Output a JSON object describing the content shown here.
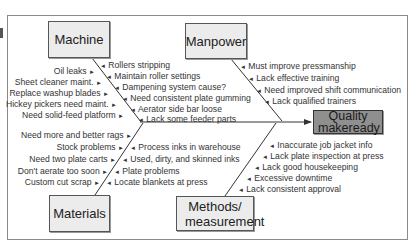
{
  "diagram": {
    "type": "fishbone",
    "effect": "Quality makeready",
    "categories": {
      "machine": {
        "title": "Machine",
        "left_causes": [
          "Oil leaks",
          "Sheet cleaner maint.",
          "Replace washup blades",
          "Hickey pickers need maint.",
          "Need solid-feed platform"
        ],
        "right_causes": [
          "Rollers stripping",
          "Maintain roller settings",
          "Dampening system cause?",
          "Need consistent plate gumming",
          "Aerator side bar loose",
          "Lack some feeder parts"
        ]
      },
      "manpower": {
        "title": "Manpower",
        "right_causes": [
          "Must improve pressmanship",
          "Lack effective training",
          "Need improved shift communication",
          "Lack qualified trainers"
        ]
      },
      "materials": {
        "title": "Materials",
        "left_causes": [
          "Need more and better rags",
          "Stock problems",
          "Need two plate carts",
          "Don't aerate too soon",
          "Custom cut scrap"
        ],
        "right_causes": [
          "Process inks in warehouse",
          "Used, dirty, and skinned inks",
          "Plate problems",
          "Locate blankets at press"
        ]
      },
      "methods": {
        "title": "Methods/ measurement",
        "right_causes": [
          "Inaccurate job jacket info",
          "Lack plate inspection at press",
          "Lack good housekeeping",
          "Excessive downtime",
          "Lack consistent approval"
        ]
      }
    },
    "arrows": {
      "left": "►",
      "right": "◄"
    }
  }
}
